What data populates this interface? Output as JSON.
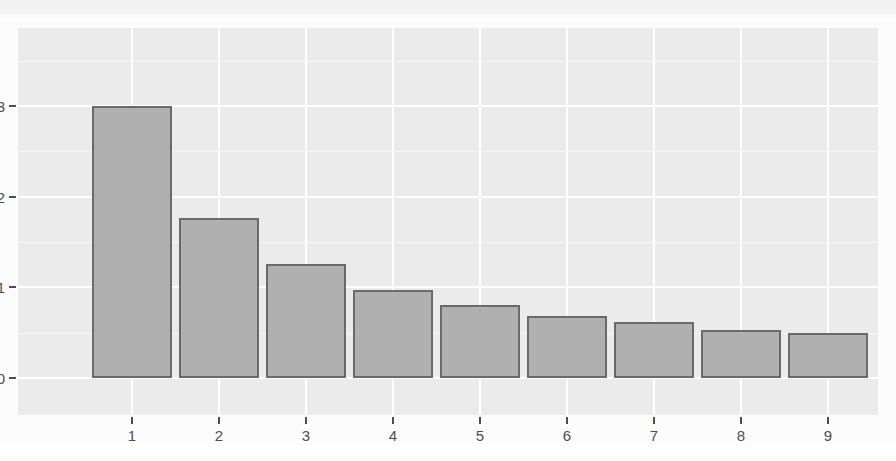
{
  "chart_data": {
    "type": "bar",
    "title": "",
    "subtitle": "",
    "xlabel": "",
    "ylabel": "",
    "categories": [
      "1",
      "2",
      "3",
      "4",
      "5",
      "6",
      "7",
      "8",
      "9"
    ],
    "values": [
      0.3,
      0.176,
      0.126,
      0.097,
      0.08,
      0.068,
      0.062,
      0.053,
      0.05
    ],
    "series": [
      {
        "name": "proportion",
        "values": [
          0.3,
          0.176,
          0.126,
          0.097,
          0.08,
          0.068,
          0.062,
          0.053,
          0.05
        ]
      }
    ],
    "ylim": [
      0.0,
      0.32
    ],
    "xlim": [
      0.5,
      9.5
    ],
    "y_ticks": [
      "0.0",
      "0.1",
      "0.2",
      "0.3"
    ],
    "y_tick_values": [
      0.0,
      0.1,
      0.2,
      0.3
    ],
    "x_ticks": [
      "1",
      "2",
      "3",
      "4",
      "5",
      "6",
      "7",
      "8",
      "9"
    ],
    "grid": true,
    "grid_color": "#ffffff",
    "legend": null,
    "legend_position": "none",
    "annotations": [],
    "bar_fill_color": "#b0b0b0",
    "bar_border_color": "#6a6a6a",
    "panel_background": "#ebebeb",
    "axis_text_color": "#4d4d4d"
  },
  "axes": {
    "y_tick_labels": [
      "0.3",
      "0.2",
      "0.1",
      "0.0"
    ],
    "x_tick_labels": [
      "1",
      "2",
      "3",
      "4",
      "5",
      "6",
      "7",
      "8",
      "9"
    ]
  }
}
